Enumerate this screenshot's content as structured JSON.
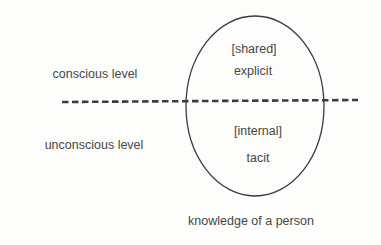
{
  "diagram": {
    "levels": {
      "upper": "conscious level",
      "lower": "unconscious level"
    },
    "ellipse": {
      "upper_tag": "[shared]",
      "upper_term": "explicit",
      "lower_tag": "[internal]",
      "lower_term": "tacit"
    },
    "caption": "knowledge of a person",
    "colors": {
      "line": "#3c3c3c",
      "text": "#474747",
      "background": "#fdfdfc"
    }
  }
}
